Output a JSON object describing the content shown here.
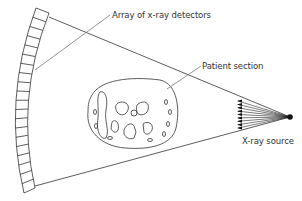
{
  "diagram": {
    "labels": {
      "detectors": "Array of x-ray detectors",
      "patient": "Patient section",
      "source": "X-ray source"
    },
    "detector_segments": 20,
    "fan_rays": 9,
    "colors": {
      "line": "#333333",
      "background": "#ffffff"
    }
  }
}
